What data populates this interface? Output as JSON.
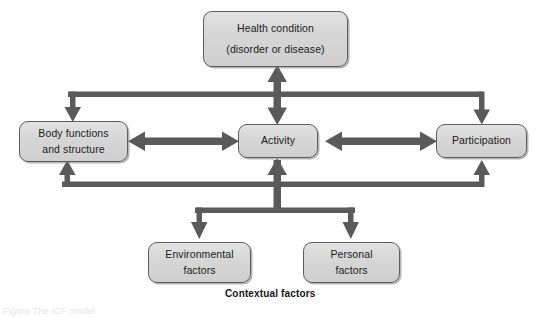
{
  "diagram": {
    "title": "ICF model",
    "palette": {
      "box_fill": "#d6d6d6",
      "box_border": "#5d5d5d",
      "arrow": "#5a5a5a",
      "background": "#ffffff",
      "text": "#1b1b1b"
    },
    "nodes": [
      {
        "id": "health_condition",
        "line1": "Health condition",
        "line2": "(disorder or disease)"
      },
      {
        "id": "body_functions",
        "line1": "Body functions",
        "line2": "and structure"
      },
      {
        "id": "activity",
        "line1": "Activity",
        "line2": ""
      },
      {
        "id": "participation",
        "line1": "Participation",
        "line2": ""
      },
      {
        "id": "environmental_factors",
        "line1": "Environmental",
        "line2": "factors"
      },
      {
        "id": "personal_factors",
        "line1": "Personal",
        "line2": "factors"
      }
    ],
    "labels": {
      "contextual_factors": "Contextual factors",
      "figure_caption": "Figure  The ICF model."
    },
    "connections": [
      {
        "from": "health_condition",
        "to": "activity",
        "style": "double-headed-vertical"
      },
      {
        "from": "body_functions",
        "to": "activity",
        "style": "double-headed-horizontal"
      },
      {
        "from": "activity",
        "to": "participation",
        "style": "double-headed-horizontal"
      },
      {
        "from": "health_condition_bus",
        "to": "body_functions",
        "style": "bus-down"
      },
      {
        "from": "health_condition_bus",
        "to": "activity",
        "style": "bus-down"
      },
      {
        "from": "health_condition_bus",
        "to": "participation",
        "style": "bus-down"
      },
      {
        "from": "contextual_bus",
        "to": "body_functions",
        "style": "bus-up"
      },
      {
        "from": "contextual_bus",
        "to": "activity",
        "style": "bus-up"
      },
      {
        "from": "contextual_bus",
        "to": "participation",
        "style": "bus-up"
      },
      {
        "from": "contextual_bus",
        "to": "environmental_factors",
        "style": "bus-down"
      },
      {
        "from": "contextual_bus",
        "to": "personal_factors",
        "style": "bus-down"
      }
    ]
  }
}
